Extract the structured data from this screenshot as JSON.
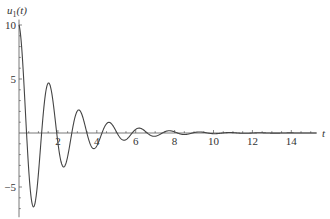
{
  "chart_data": {
    "type": "line",
    "title": "",
    "xlabel": "t",
    "ylabel": "u1(t)",
    "ylabel_display": {
      "base": "u",
      "sub": "1",
      "arg": "(t)"
    },
    "xlim": [
      0,
      15.3
    ],
    "ylim": [
      -7.8,
      10.5
    ],
    "x_ticks": [
      2,
      4,
      6,
      8,
      10,
      12,
      14
    ],
    "x_tick_labels": [
      "2",
      "4",
      "6",
      "8",
      "10",
      "12",
      "14"
    ],
    "y_ticks": [
      10,
      5,
      -5
    ],
    "y_tick_labels": [
      "10",
      "5",
      "−5"
    ],
    "grid": false,
    "legend": null,
    "series": [
      {
        "name": "u1(t)",
        "formula_approx": "10*exp(-0.5*t)*cos(4.05*t)",
        "amplitude": 10,
        "decay": 0.5,
        "omega": 4.05,
        "t_range": [
          0,
          15.3
        ],
        "key_points": [
          {
            "t": 0,
            "u": 10
          },
          {
            "t": 0.78,
            "u": -6.8
          },
          {
            "t": 1.55,
            "u": 4.6
          },
          {
            "t": 2.33,
            "u": -3.1
          },
          {
            "t": 3.1,
            "u": 2.1
          },
          {
            "t": 3.88,
            "u": -1.4
          },
          {
            "t": 4.65,
            "u": 1.0
          },
          {
            "t": 5.43,
            "u": -0.66
          },
          {
            "t": 6.2,
            "u": 0.45
          },
          {
            "t": 7.75,
            "u": 0.21
          }
        ]
      }
    ]
  }
}
